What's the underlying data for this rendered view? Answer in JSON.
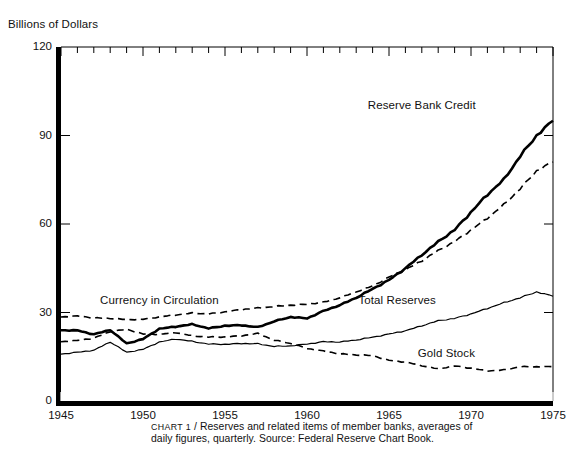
{
  "figure": {
    "y_axis_title": "Billions of Dollars",
    "caption_prefix": "CHART 1",
    "caption_separator": " / ",
    "caption_text": "Reserves and related items of member banks, averages of daily figures, quarterly. Source: Federal Reserve Chart Book."
  },
  "chart_data": {
    "type": "line",
    "title": "Reserves and related items of member banks",
    "subtitle": "averages of daily figures, quarterly",
    "source": "Federal Reserve Chart Book",
    "xlabel": "",
    "ylabel": "Billions of Dollars",
    "xlim": [
      1945,
      1975
    ],
    "ylim": [
      0,
      120
    ],
    "yticks": [
      0,
      30,
      60,
      90,
      120
    ],
    "ytick_labels": [
      "0",
      "30",
      "60",
      "90",
      "120"
    ],
    "xticks": [
      1945,
      1950,
      1955,
      1960,
      1965,
      1970,
      1975
    ],
    "xtick_labels": [
      "1945",
      "1950",
      "1955",
      "1960",
      "1965",
      "1970",
      "1975"
    ],
    "minor_xticks_interval": 1,
    "grid": false,
    "legend": "inline-annotations",
    "x": [
      1945,
      1946,
      1947,
      1948,
      1949,
      1950,
      1951,
      1952,
      1953,
      1954,
      1955,
      1956,
      1957,
      1958,
      1959,
      1960,
      1961,
      1962,
      1963,
      1964,
      1965,
      1966,
      1967,
      1968,
      1969,
      1970,
      1971,
      1972,
      1973,
      1974,
      1975
    ],
    "series": [
      {
        "name": "Reserve Bank Credit",
        "style": "thick-solid",
        "color": "#000000",
        "label_x": 1967.0,
        "label_y": 100,
        "values": [
          24.0,
          23.9,
          22.6,
          24.1,
          19.5,
          21.0,
          24.5,
          25.2,
          26.0,
          24.6,
          25.5,
          25.7,
          25.0,
          27.0,
          28.5,
          28.0,
          30.5,
          32.5,
          35.0,
          38.0,
          41.0,
          45.0,
          49.5,
          54.0,
          58.0,
          64.0,
          70.0,
          75.0,
          83.0,
          90.0,
          95.0
        ]
      },
      {
        "name": "Currency in Circulation",
        "style": "dashed",
        "color": "#000000",
        "label_x": 1951.0,
        "label_y": 34,
        "values": [
          28.5,
          28.8,
          28.2,
          28.0,
          27.6,
          27.7,
          28.5,
          29.2,
          29.8,
          29.5,
          30.2,
          31.0,
          31.5,
          32.0,
          32.5,
          32.8,
          33.5,
          35.0,
          37.0,
          39.0,
          42.0,
          44.5,
          47.5,
          51.0,
          54.0,
          58.0,
          62.0,
          66.5,
          72.0,
          78.0,
          81.0
        ]
      },
      {
        "name": "Total Reserves",
        "style": "thin-solid",
        "color": "#000000",
        "label_x": 1965.5,
        "label_y": 34,
        "values": [
          15.9,
          16.5,
          17.2,
          20.0,
          16.5,
          17.5,
          20.0,
          21.0,
          20.2,
          19.3,
          19.2,
          19.5,
          19.4,
          18.5,
          18.7,
          19.3,
          20.1,
          20.0,
          20.7,
          21.6,
          22.7,
          23.8,
          25.5,
          27.2,
          28.0,
          29.5,
          31.4,
          33.3,
          35.0,
          37.0,
          35.5
        ]
      },
      {
        "name": "Gold Stock",
        "style": "dashed",
        "color": "#000000",
        "label_x": 1968.5,
        "label_y": 16,
        "values": [
          20.1,
          20.5,
          21.3,
          23.5,
          24.3,
          22.7,
          22.6,
          23.2,
          22.1,
          21.7,
          21.7,
          22.1,
          22.9,
          20.6,
          19.5,
          17.8,
          16.9,
          16.0,
          15.6,
          15.4,
          13.8,
          13.2,
          12.0,
          10.9,
          11.9,
          11.1,
          10.2,
          10.5,
          11.6,
          11.6,
          11.6
        ]
      }
    ]
  }
}
